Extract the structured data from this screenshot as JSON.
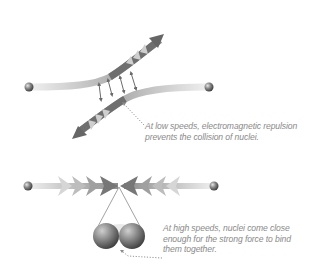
{
  "diagram": {
    "colors": {
      "arrow_dark": "#6b6b6b",
      "arrow_light": "#d8d8d8",
      "nucleus": "#7a7a7a",
      "caption_text": "#8a8a8a",
      "leader_line": "#8a8a8a"
    },
    "low_speed": {
      "caption_lines": [
        "At low speeds, electromagnetic repulsion",
        "prevents the collision of nuclei."
      ],
      "elements": [
        "nucleus-left",
        "nucleus-right",
        "deflected-path-up-right",
        "deflected-path-down-left",
        "repulsion-arrows"
      ],
      "repulsion_arrow_count": 4
    },
    "high_speed": {
      "caption_lines": [
        "At high speeds, nuclei come close",
        "enough for the strong force to bind",
        "them together."
      ],
      "elements": [
        "nucleus-left",
        "nucleus-right",
        "incoming-chevrons-left",
        "incoming-chevrons-right",
        "zoom-lines",
        "fused-nuclei-pair"
      ],
      "chevrons_per_side": 4
    }
  }
}
